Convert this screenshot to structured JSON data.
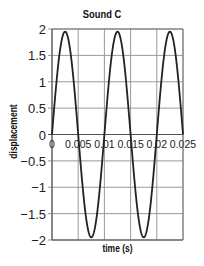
{
  "chart_data": {
    "type": "line",
    "title": "Sound C",
    "xlabel": "time (s)",
    "ylabel": "displacement",
    "xlim": [
      0,
      0.025
    ],
    "ylim": [
      -2,
      2
    ],
    "x_ticks": [
      "0",
      "0.005",
      "0.01",
      "0.015",
      "0.02",
      "0.025"
    ],
    "y_ticks": [
      "2",
      "1.5",
      "1",
      "0.5",
      "0",
      "−0.5",
      "−1",
      "−1.5",
      "−2"
    ],
    "grid": true,
    "series": [
      {
        "name": "Sound C",
        "function": "1.95*sin(2*pi*100*t)",
        "amplitude": 1.95,
        "frequency_hz": 100,
        "period_s": 0.01,
        "x": [
          0,
          0.0025,
          0.005,
          0.0075,
          0.01,
          0.0125,
          0.015,
          0.0175,
          0.02,
          0.0225,
          0.025
        ],
        "values": [
          0,
          1.95,
          0,
          -1.95,
          0,
          1.95,
          0,
          -1.95,
          0,
          1.95,
          0
        ]
      }
    ],
    "colors": {
      "line": "#222222",
      "grid": "#999999"
    }
  }
}
